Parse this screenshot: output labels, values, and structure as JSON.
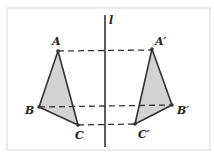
{
  "diagram": {
    "type": "reflection",
    "axis": {
      "label": "l",
      "x": 105,
      "y1": 15,
      "y2": 147
    },
    "frame": {
      "x": 7,
      "y": 8,
      "width": 203,
      "height": 142,
      "stroke": "#d8d8d8"
    },
    "colors": {
      "fill": "#d3d3d3",
      "stroke": "#333333",
      "dash": "#333333"
    },
    "points": {
      "A": {
        "label": "A",
        "x": 58,
        "y": 51,
        "lx": 52,
        "ly": 44
      },
      "B": {
        "label": "B",
        "x": 39,
        "y": 107,
        "lx": 25,
        "ly": 116
      },
      "C": {
        "label": "C",
        "x": 78,
        "y": 125,
        "lx": 76,
        "ly": 138
      },
      "A1": {
        "label": "A′",
        "x": 152,
        "y": 49,
        "lx": 155,
        "ly": 44
      },
      "B1": {
        "label": "B′",
        "x": 172,
        "y": 105,
        "lx": 177,
        "ly": 116
      },
      "C1": {
        "label": "C′",
        "x": 135,
        "y": 124,
        "lx": 139,
        "ly": 137
      }
    },
    "triangles": [
      {
        "name": "ABC",
        "vertices": [
          "A",
          "B",
          "C"
        ]
      },
      {
        "name": "A′B′C′",
        "vertices": [
          "A1",
          "B1",
          "C1"
        ]
      }
    ],
    "dashed_segments": [
      {
        "from": "A",
        "to": "A1"
      },
      {
        "from": "B",
        "to": "B1"
      },
      {
        "from": "C",
        "to": "C1"
      }
    ]
  }
}
